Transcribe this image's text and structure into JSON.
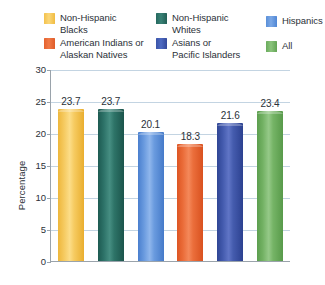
{
  "legend": {
    "items": [
      {
        "label": "Non-Hispanic Blacks",
        "line1": "Non-Hispanic",
        "line2": "Blacks",
        "color": "#f5c95e",
        "swatch": "sw-yellow"
      },
      {
        "label": "Non-Hispanic Whites",
        "line1": "Non-Hispanic",
        "line2": "Whites",
        "color": "#2d7268",
        "swatch": "sw-teal"
      },
      {
        "label": "Hispanics",
        "line1": "Hispanics",
        "line2": "",
        "color": "#6899de",
        "swatch": "sw-ltblue"
      },
      {
        "label": "American Indians or Alaskan Natives",
        "line1": "American Indians or",
        "line2": "Alaskan Natives",
        "color": "#ea6b38",
        "swatch": "sw-orange"
      },
      {
        "label": "Asians or Pacific Islanders",
        "line1": "Asians or",
        "line2": "Pacific Islanders",
        "color": "#435aad",
        "swatch": "sw-indigo"
      },
      {
        "label": "All",
        "line1": "All",
        "line2": "",
        "color": "#72b163",
        "swatch": "sw-green"
      }
    ]
  },
  "chart_data": {
    "type": "bar",
    "title": "",
    "xlabel": "",
    "ylabel": "Percentage",
    "ylim": [
      0,
      30
    ],
    "yticks": [
      30,
      25,
      20,
      15,
      10,
      5,
      0
    ],
    "ytick_labels": [
      "30",
      "25",
      "20",
      "15",
      "10",
      "5",
      "0"
    ],
    "grid": true,
    "legend_position": "top",
    "categories": [
      "Non-Hispanic Blacks",
      "Non-Hispanic Whites",
      "Hispanics",
      "American Indians or Alaskan Natives",
      "Asians or Pacific Islanders",
      "All"
    ],
    "values": [
      23.7,
      23.7,
      20.1,
      18.3,
      21.6,
      23.4
    ],
    "value_labels": [
      "23.7",
      "23.7",
      "20.1",
      "18.3",
      "21.6",
      "23.4"
    ],
    "colors": [
      "#f5c95e",
      "#2d7268",
      "#6899de",
      "#ea6b38",
      "#435aad",
      "#72b163"
    ],
    "bar_classes": [
      "b-yellow",
      "b-teal",
      "b-ltblue",
      "b-orange",
      "b-indigo",
      "b-green"
    ]
  }
}
